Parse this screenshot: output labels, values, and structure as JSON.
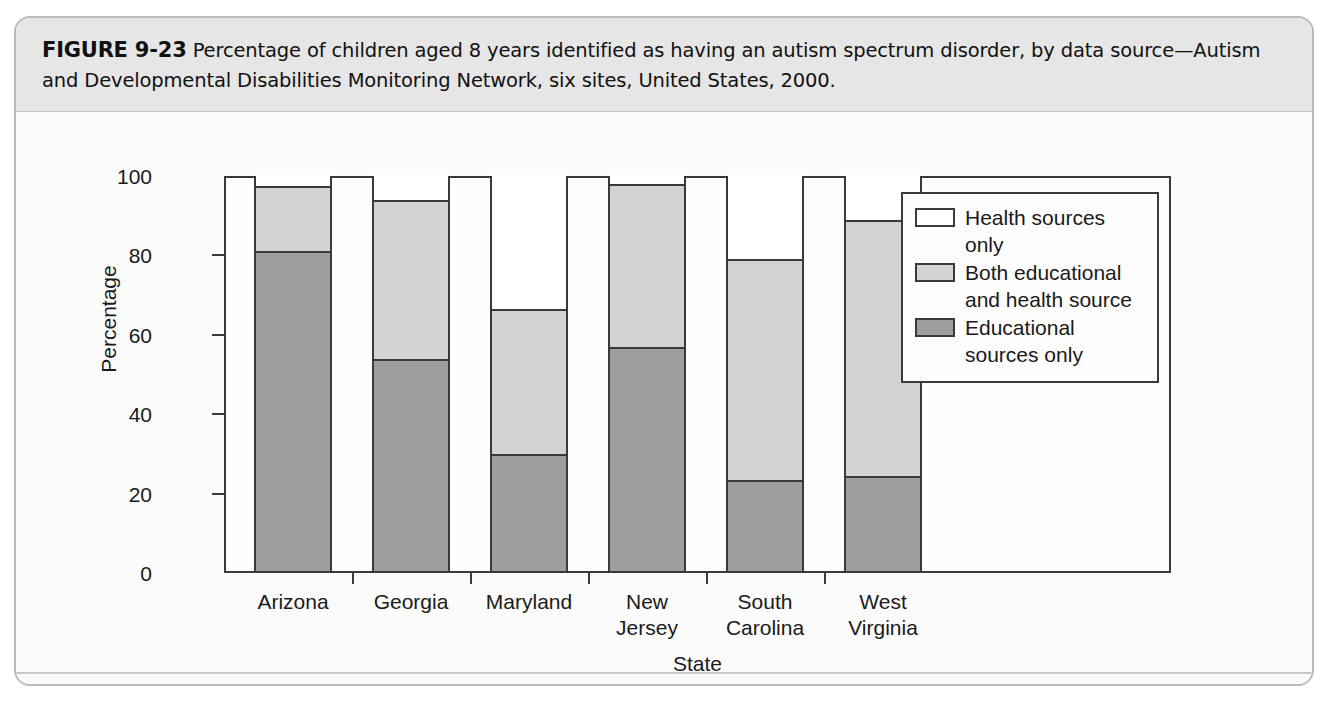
{
  "figure": {
    "label": "FIGURE 9-23",
    "caption": " Percentage of children aged 8 years identified as having an autism spectrum disorder, by data source—Autism and Developmental Disabilities Monitoring Network, six sites, United States, 2000."
  },
  "chart_data": {
    "type": "bar",
    "subtype": "stacked-bar-100",
    "title": "",
    "xlabel": "State",
    "ylabel": "Percentage",
    "ylim": [
      0,
      100
    ],
    "yticks": [
      0,
      20,
      40,
      60,
      80,
      100
    ],
    "ytick_labels": [
      "0",
      "20",
      "40",
      "60",
      "80",
      "100"
    ],
    "grid": false,
    "legend_position": "top-right-inside",
    "categories": [
      "Arizona",
      "Georgia",
      "Maryland",
      "New Jersey",
      "South Carolina",
      "West Virginia"
    ],
    "category_lines": [
      [
        "Arizona"
      ],
      [
        "Georgia"
      ],
      [
        "Maryland"
      ],
      [
        "New",
        "Jersey"
      ],
      [
        "South",
        "Carolina"
      ],
      [
        "West",
        "Virginia"
      ]
    ],
    "series": [
      {
        "name": "Educational sources only",
        "color": "#9e9e9e",
        "values": [
          80,
          53,
          29,
          56,
          22.5,
          23.5
        ]
      },
      {
        "name": "Both educational and health source",
        "color": "#d3d3d3",
        "values": [
          17,
          40.5,
          37,
          41.5,
          56,
          65
        ]
      },
      {
        "name": "Health sources only",
        "color": "#ffffff",
        "values": [
          3,
          6.5,
          34,
          2.5,
          21.5,
          11.5
        ]
      }
    ],
    "cumulative_tops": {
      "educational_only": [
        80,
        53,
        29,
        56,
        22.5,
        23.5
      ],
      "plus_both": [
        97,
        93.5,
        66,
        97.5,
        78.5,
        88.5
      ],
      "total": [
        100,
        100,
        100,
        100,
        100,
        100
      ]
    }
  },
  "legend": {
    "items": [
      {
        "label": "Health sources only",
        "swatch": "swatch-health-only",
        "color": "#ffffff"
      },
      {
        "label": "Both educational\nand health source",
        "swatch": "swatch-both",
        "color": "#d3d3d3"
      },
      {
        "label": "Educational\nsources only",
        "swatch": "swatch-educational-only",
        "color": "#9e9e9e"
      }
    ]
  },
  "colors": {
    "educational_only": "#9e9e9e",
    "both": "#d3d3d3",
    "health_only": "#ffffff",
    "axis": "#3a3a3a",
    "caption_band": "#e6e6e6"
  }
}
